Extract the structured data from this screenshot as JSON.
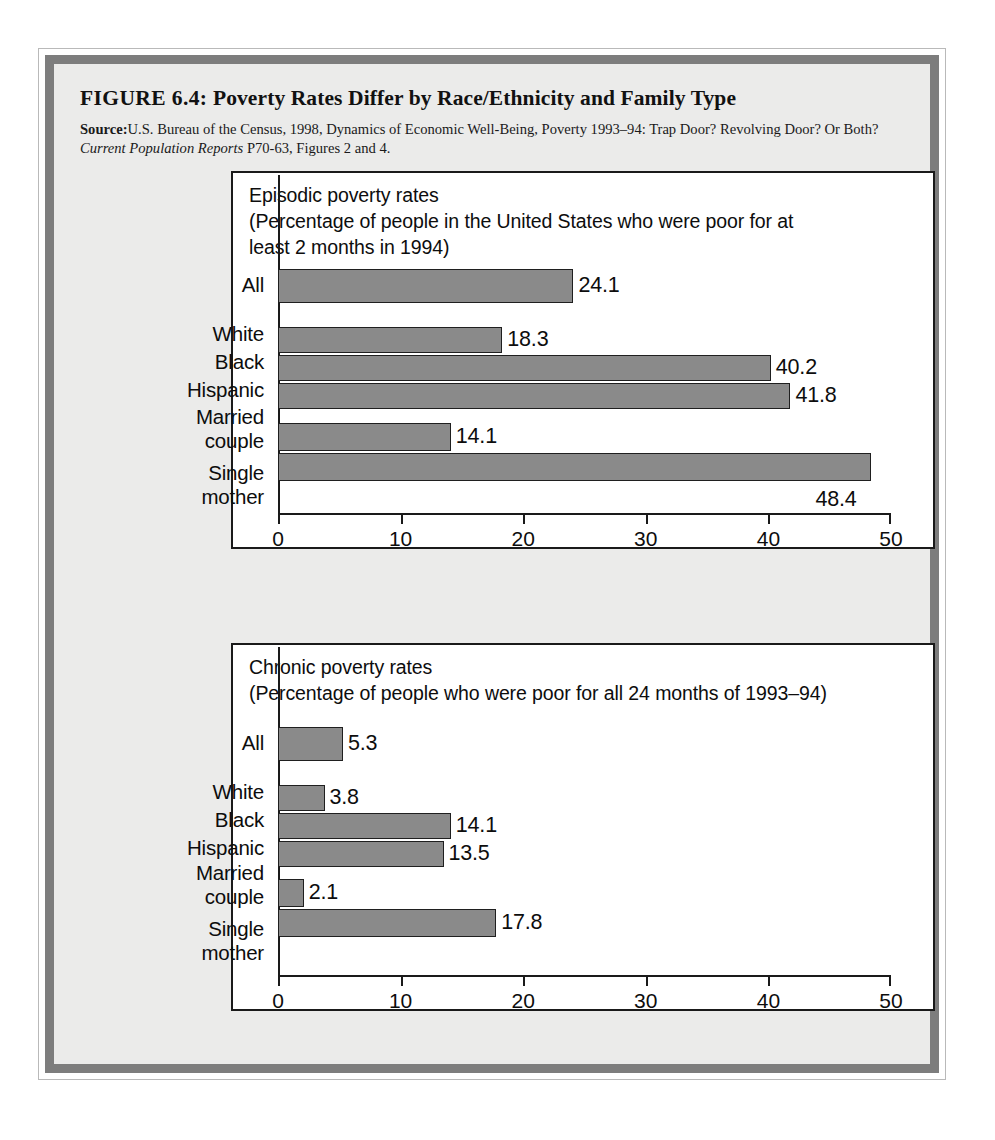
{
  "figure": {
    "number_label": "FIGURE 6.4:",
    "title": "Poverty Rates Differ by Race/Ethnicity and Family Type",
    "source_label": "Source:",
    "source_text_1": "U.S. Bureau of the Census, 1998, Dynamics of Economic Well-Being, Poverty 1993–94: Trap Door? Revolving Door? Or Both? ",
    "source_italic": "Current Population Reports",
    "source_text_2": " P70-63, Figures 2 and 4."
  },
  "chart_data": [
    {
      "type": "bar",
      "orientation": "horizontal",
      "title": "Episodic poverty rates\n(Percentage of people in the United States who were poor for at\nleast 2 months in 1994)",
      "categories": [
        "All",
        "White",
        "Black",
        "Hispanic",
        "Married\ncouple",
        "Single\nmother"
      ],
      "values": [
        24.1,
        18.3,
        40.2,
        41.8,
        14.1,
        48.4
      ],
      "value_labels": [
        "24.1",
        "18.3",
        "40.2",
        "41.8",
        "14.1",
        "48.4"
      ],
      "xlabel": "",
      "ylabel": "",
      "xlim": [
        0,
        50
      ],
      "xticks": [
        0,
        10,
        20,
        30,
        40,
        50
      ],
      "xtick_labels": [
        "0",
        "10",
        "20",
        "30",
        "40",
        "50"
      ],
      "grid": false,
      "legend": false,
      "bar_color": "#8a8a8a",
      "bar_edge_color": "#1f1f1f"
    },
    {
      "type": "bar",
      "orientation": "horizontal",
      "title": "Chronic poverty rates\n(Percentage of people who were poor for all 24 months of 1993–94)",
      "categories": [
        "All",
        "White",
        "Black",
        "Hispanic",
        "Married\ncouple",
        "Single\nmother"
      ],
      "values": [
        5.3,
        3.8,
        14.1,
        13.5,
        2.1,
        17.8
      ],
      "value_labels": [
        "5.3",
        "3.8",
        "14.1",
        "13.5",
        "2.1",
        "17.8"
      ],
      "xlabel": "",
      "ylabel": "",
      "xlim": [
        0,
        50
      ],
      "xticks": [
        0,
        10,
        20,
        30,
        40,
        50
      ],
      "xtick_labels": [
        "0",
        "10",
        "20",
        "30",
        "40",
        "50"
      ],
      "grid": false,
      "legend": false,
      "bar_color": "#8a8a8a",
      "bar_edge_color": "#1f1f1f"
    }
  ]
}
